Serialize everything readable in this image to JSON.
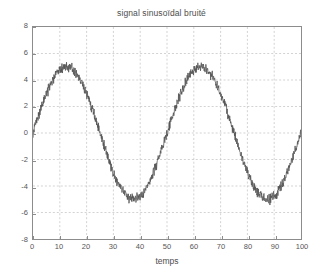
{
  "chart_data": {
    "type": "line",
    "title": "signal sinusoïdal bruité",
    "xlabel": "temps",
    "ylabel": "",
    "xlim": [
      0,
      100
    ],
    "ylim": [
      -8,
      8
    ],
    "xticks": [
      0,
      10,
      20,
      30,
      40,
      50,
      60,
      70,
      80,
      90,
      100
    ],
    "yticks": [
      8,
      6,
      4,
      2,
      0,
      -2,
      -4,
      -6,
      -8
    ],
    "grid": true,
    "grid_style": "dashed",
    "grid_color": "#bfbfbf",
    "legend": null,
    "series": [
      {
        "name": "signal sinusoïdal bruité",
        "color": "#555555",
        "line_width": 0.8,
        "description": "noisy sinusoid, amplitude 5, period 50, zero phase",
        "amplitude": 5,
        "period": 50,
        "phase": 0,
        "noise_amplitude": 0.35,
        "n_points": 1000,
        "x": [
          0,
          5,
          10,
          12.5,
          15,
          20,
          25,
          30,
          35,
          37.5,
          40,
          45,
          50,
          55,
          60,
          62.5,
          65,
          70,
          75,
          80,
          85,
          87.5,
          90,
          95,
          100
        ],
        "y": [
          0.0,
          3.0,
          4.8,
          5.0,
          4.8,
          3.0,
          0.0,
          -3.0,
          -4.8,
          -5.0,
          -4.8,
          -3.0,
          0.0,
          3.0,
          4.8,
          5.0,
          4.8,
          3.0,
          0.0,
          -3.0,
          -4.8,
          -5.0,
          -4.8,
          -3.0,
          0.0
        ]
      }
    ]
  },
  "figure": {
    "background_color": "#ffffff",
    "axes_color": "#8c8c8c",
    "text_color": "#4d4d4d"
  }
}
